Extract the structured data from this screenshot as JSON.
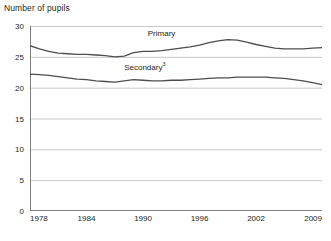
{
  "chart_data": {
    "type": "line",
    "title": "Number of pupils",
    "xlabel": "",
    "ylabel": "",
    "xlim": [
      1978,
      2009
    ],
    "ylim": [
      0,
      30
    ],
    "ytick_values": [
      0,
      5,
      10,
      15,
      20,
      25,
      30
    ],
    "ytick_labels": [
      "0",
      "5",
      "10",
      "15",
      "20",
      "25",
      "30"
    ],
    "xtick_values": [
      1978,
      1984,
      1990,
      1996,
      2002,
      2009
    ],
    "xtick_labels": [
      "1978",
      "1984",
      "1990",
      "1996",
      "2002",
      "2009"
    ],
    "grid": true,
    "grid_axis": "y",
    "legend_position": "inline-annotation",
    "x": [
      1978,
      1979,
      1980,
      1981,
      1982,
      1983,
      1984,
      1985,
      1986,
      1987,
      1988,
      1989,
      1990,
      1991,
      1992,
      1993,
      1994,
      1995,
      1996,
      1997,
      1998,
      1999,
      2000,
      2001,
      2002,
      2003,
      2004,
      2005,
      2006,
      2007,
      2008,
      2009
    ],
    "series": [
      {
        "name": "Primary",
        "label": "Primary",
        "color": "#4d4d4d",
        "values": [
          26.8,
          26.3,
          25.9,
          25.6,
          25.5,
          25.4,
          25.4,
          25.3,
          25.2,
          25.0,
          25.1,
          25.7,
          25.9,
          25.9,
          26.0,
          26.2,
          26.4,
          26.6,
          26.9,
          27.3,
          27.6,
          27.8,
          27.7,
          27.4,
          27.0,
          26.7,
          26.4,
          26.3,
          26.3,
          26.3,
          26.4,
          26.5
        ]
      },
      {
        "name": "Secondary",
        "label": "Secondary",
        "footnote_marker": "3",
        "color": "#4d4d4d",
        "values": [
          22.2,
          22.1,
          22.0,
          21.8,
          21.6,
          21.4,
          21.3,
          21.1,
          21.0,
          20.9,
          21.1,
          21.3,
          21.2,
          21.1,
          21.1,
          21.2,
          21.2,
          21.3,
          21.4,
          21.5,
          21.6,
          21.6,
          21.7,
          21.7,
          21.7,
          21.7,
          21.6,
          21.5,
          21.3,
          21.1,
          20.8,
          20.5
        ]
      }
    ],
    "annotations": [
      {
        "text": "Primary",
        "x": 1990.5,
        "y": 28.6
      },
      {
        "text": "Secondary",
        "x": 1988.0,
        "y": 23.1
      }
    ],
    "colors": {
      "background": "#ffffff",
      "gridline": "#c8c8c8",
      "axis": "#808080",
      "text": "#231f20",
      "line": "#4d4d4d"
    }
  }
}
